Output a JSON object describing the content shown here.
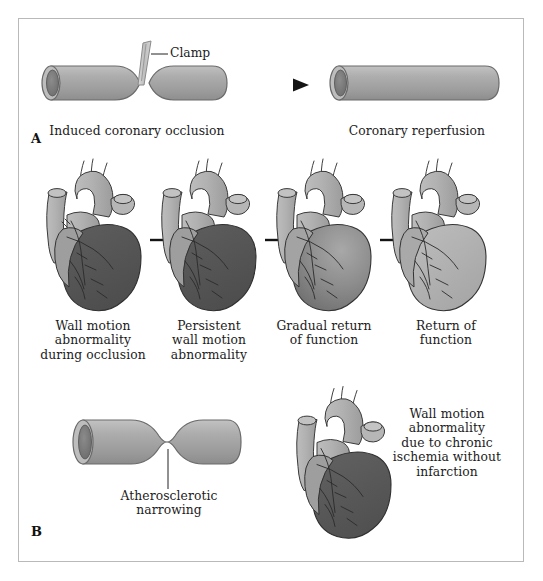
{
  "figure": {
    "type": "medical-illustration",
    "title_visible": false,
    "panels": [
      {
        "letter": "A",
        "name": "acute-occlusion-reperfusion",
        "items": [
          {
            "name": "clamp-label",
            "text": "Clamp"
          },
          {
            "name": "induced-occlusion-caption",
            "text": "Induced coronary occlusion"
          },
          {
            "name": "coronary-reperfusion-caption",
            "text": "Coronary reperfusion"
          }
        ]
      },
      {
        "letter": "B",
        "name": "chronic-ischemia",
        "items": [
          {
            "name": "atherosclerotic-narrowing-label",
            "text": "Atherosclerotic\nnarrowing"
          },
          {
            "name": "chronic-ischemia-caption",
            "text": "Wall motion\nabnormality\ndue to chronic\nischemia without\ninfarction"
          }
        ]
      }
    ],
    "heart_sequence": [
      {
        "index": 1,
        "caption": "Wall motion\nabnormality\nduring occlusion",
        "state": "full-infarct-dark"
      },
      {
        "index": 2,
        "caption": "Persistent\nwall motion\nabnormality",
        "state": "full-infarct-dark"
      },
      {
        "index": 3,
        "caption": "Gradual return\nof function",
        "state": "partial-gradient"
      },
      {
        "index": 4,
        "caption": "Return of\nfunction",
        "state": "normal-light"
      }
    ],
    "arrows": [
      {
        "name": "arrow-occlusion-to-reperfusion",
        "direction": "right"
      },
      {
        "name": "arrow-heart-1-to-2",
        "direction": "right"
      },
      {
        "name": "arrow-heart-2-to-3",
        "direction": "right"
      },
      {
        "name": "arrow-heart-3-to-4",
        "direction": "right"
      }
    ],
    "colors": {
      "frame_border": "#b9b9b9",
      "background": "#ffffff",
      "vessel_body": "#a8a8a8",
      "vessel_outline": "#6a6a6a",
      "vessel_lumen": "#7c7c7c",
      "heart_light": "#b0b0b0",
      "heart_dark": "#565656",
      "heart_outline": "#3a3a3a",
      "text": "#1c1c1c",
      "arrow": "#141414"
    }
  }
}
